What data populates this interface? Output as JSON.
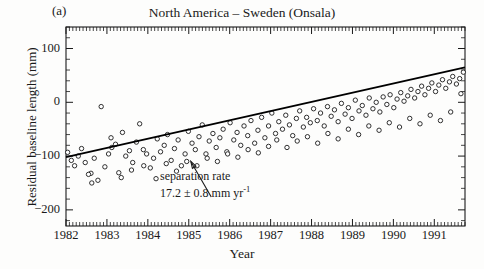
{
  "panel": {
    "label": "(a)"
  },
  "chart_data": {
    "type": "scatter",
    "title": "North America – Sweden (Onsala)",
    "xlabel": "Year",
    "ylabel": "Residual baseline length (mm)",
    "xlim": [
      1982.0,
      1991.75
    ],
    "ylim": [
      -230,
      140
    ],
    "grid": false,
    "legend": null,
    "xticks": [
      1982,
      1983,
      1984,
      1985,
      1986,
      1987,
      1988,
      1989,
      1990,
      1991
    ],
    "xtick_labels": [
      "1982",
      "1983",
      "1984",
      "1985",
      "1986",
      "1987",
      "1988",
      "1989",
      "1990",
      "1991"
    ],
    "x_minor_per_major": 12,
    "yticks": [
      100,
      0,
      -100,
      -200
    ],
    "ytick_labels": [
      "100",
      "0",
      "−100",
      "−200"
    ],
    "y_minor_step": 20,
    "marker": "open-circle",
    "marker_size_px": 4.4,
    "series": [
      {
        "name": "Residual baseline length",
        "x": [
          1982.04,
          1982.13,
          1982.21,
          1982.3,
          1982.38,
          1982.47,
          1982.61,
          1982.69,
          1982.78,
          1982.86,
          1982.95,
          1983.04,
          1983.12,
          1983.21,
          1983.29,
          1983.38,
          1983.46,
          1983.55,
          1983.63,
          1983.72,
          1983.8,
          1983.89,
          1983.97,
          1984.06,
          1984.14,
          1984.23,
          1984.31,
          1984.4,
          1984.48,
          1984.57,
          1984.65,
          1984.74,
          1984.82,
          1984.91,
          1984.99,
          1985.08,
          1985.16,
          1985.25,
          1985.33,
          1985.42,
          1985.5,
          1985.59,
          1985.67,
          1985.76,
          1985.84,
          1985.93,
          1986.01,
          1986.1,
          1986.18,
          1986.27,
          1986.35,
          1986.44,
          1986.52,
          1986.61,
          1986.69,
          1986.78,
          1986.86,
          1986.95,
          1987.03,
          1987.12,
          1987.2,
          1987.29,
          1987.37,
          1987.46,
          1987.54,
          1987.63,
          1987.71,
          1987.8,
          1987.88,
          1987.97,
          1988.05,
          1988.14,
          1988.22,
          1988.31,
          1988.39,
          1988.48,
          1988.56,
          1988.65,
          1988.73,
          1988.82,
          1988.9,
          1988.99,
          1989.07,
          1989.16,
          1989.24,
          1989.33,
          1989.41,
          1989.5,
          1989.58,
          1989.67,
          1989.75,
          1989.84,
          1989.92,
          1990.01,
          1990.09,
          1990.18,
          1990.26,
          1990.35,
          1990.43,
          1990.52,
          1990.6,
          1990.69,
          1990.77,
          1990.86,
          1990.94,
          1991.03,
          1991.11,
          1991.2,
          1991.28,
          1991.37,
          1991.45,
          1991.54,
          1991.62,
          1991.71,
          1982.55,
          1982.63,
          1983.1,
          1983.35,
          1983.6,
          1983.9,
          1984.2,
          1984.45,
          1984.7,
          1984.95,
          1985.2,
          1985.45,
          1985.7,
          1985.95,
          1986.2,
          1986.45,
          1986.7,
          1986.95,
          1987.15,
          1987.4,
          1987.65,
          1987.9,
          1988.15,
          1988.4,
          1988.65,
          1988.9,
          1989.15,
          1989.4,
          1989.65,
          1989.9,
          1990.15,
          1990.4,
          1990.65,
          1990.9,
          1991.15,
          1991.4,
          1991.65
        ],
        "y": [
          -93,
          -108,
          -118,
          -100,
          -86,
          -112,
          -132,
          -104,
          -145,
          -8,
          -120,
          -96,
          -84,
          -78,
          -131,
          -56,
          -100,
          -90,
          -112,
          -74,
          -40,
          -88,
          -96,
          -122,
          -104,
          -68,
          -92,
          -80,
          -60,
          -108,
          -86,
          -70,
          -118,
          -96,
          -54,
          -76,
          -88,
          -64,
          -42,
          -96,
          -72,
          -58,
          -84,
          -66,
          -50,
          -92,
          -38,
          -70,
          -56,
          -80,
          -44,
          -62,
          -34,
          -76,
          -52,
          -28,
          -66,
          -44,
          -20,
          -58,
          -36,
          -50,
          -24,
          -42,
          -62,
          -30,
          -16,
          -46,
          -28,
          -38,
          -12,
          -34,
          -20,
          -44,
          -8,
          -26,
          -14,
          -36,
          -2,
          -22,
          -10,
          -30,
          4,
          -16,
          -6,
          -24,
          8,
          -12,
          0,
          -18,
          10,
          -4,
          14,
          -10,
          6,
          18,
          2,
          12,
          24,
          8,
          20,
          30,
          14,
          26,
          36,
          20,
          32,
          42,
          26,
          38,
          48,
          34,
          44,
          56,
          -134,
          -150,
          -66,
          -140,
          -126,
          -118,
          -142,
          -114,
          -128,
          -110,
          -118,
          -104,
          -110,
          -96,
          -102,
          -88,
          -94,
          -82,
          -70,
          -84,
          -72,
          -64,
          -76,
          -58,
          -68,
          -50,
          -60,
          -44,
          -52,
          -38,
          -46,
          -30,
          -40,
          -24,
          -34,
          -18,
          16
        ]
      }
    ],
    "fit_line": {
      "name": "separation rate fit",
      "x_start": 1982.0,
      "x_end": 1991.75,
      "y_start": -102,
      "y_end": 65,
      "slope_mm_per_yr": 17.2,
      "slope_uncertainty": 0.8
    },
    "annotation": {
      "line1": "separation rate",
      "line2_value": "17.2 ± 0.8 mm yr",
      "line2_exponent": "-1",
      "arrow_from": {
        "x": 1985.55,
        "y": -176
      },
      "arrow_to": {
        "x": 1985.05,
        "y": -110
      }
    },
    "colors": {
      "axis": "#1a1a1a",
      "marker_stroke": "#1a1a1a",
      "marker_fill": "#ffffff",
      "fit_line": "#000000",
      "background": "#fdfdfc",
      "text": "#1a1a1a"
    }
  }
}
